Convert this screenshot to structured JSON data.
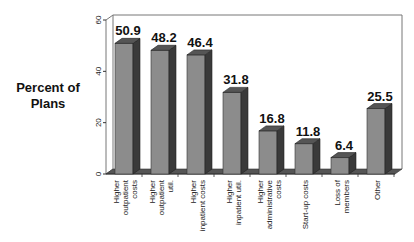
{
  "chart_data": {
    "type": "bar",
    "title": "",
    "xlabel": "",
    "ylabel": "Percent of Plans",
    "ylabel_lines": [
      "Percent of",
      "Plans"
    ],
    "ylim": [
      0,
      60
    ],
    "yticks": [
      0,
      20,
      40,
      60
    ],
    "grid": false,
    "legend": null,
    "style": "3d",
    "categories": [
      [
        "Higher",
        "outpatient",
        "costs"
      ],
      [
        "Higher",
        "outpatient",
        "util."
      ],
      [
        "Higher",
        "inpatient costs"
      ],
      [
        "Higher",
        "inpatient util."
      ],
      [
        "Higher",
        "administrative",
        "costs"
      ],
      [
        "Start-up costs"
      ],
      [
        "Loss of",
        "members"
      ],
      [
        "Other"
      ]
    ],
    "category_names": [
      "Higher outpatient costs",
      "Higher outpatient util.",
      "Higher inpatient costs",
      "Higher inpatient util.",
      "Higher administrative costs",
      "Start-up costs",
      "Loss of members",
      "Other"
    ],
    "values": [
      50.9,
      48.2,
      46.4,
      31.8,
      16.8,
      11.8,
      6.4,
      25.5
    ],
    "value_labels": [
      "50.9",
      "48.2",
      "46.4",
      "31.8",
      "16.8",
      "11.8",
      "6.4",
      "25.5"
    ]
  },
  "colors": {
    "bar_front": "#8c8c8c",
    "bar_side": "#3a3a3a",
    "bar_top": "#555555",
    "frame": "#777777",
    "floor": "#555555"
  }
}
